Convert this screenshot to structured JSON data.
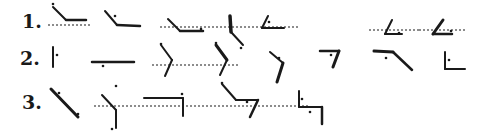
{
  "diagram": {
    "ink_color": "#1a1a1a",
    "background": "#ffffff",
    "rows": [
      {
        "label": "1.",
        "label_pos": [
          22,
          12
        ],
        "figures": [
          {
            "name": "figure-1-1",
            "baselines": [
              [
                48,
                25,
                92,
                25
              ]
            ],
            "strokes": [
              [
                53,
                7,
                66,
                20,
                2
              ],
              [
                66,
                20,
                86,
                20,
                2.5
              ]
            ],
            "dots": [
              [
                53,
                4
              ]
            ]
          },
          {
            "name": "figure-1-2",
            "baselines": [],
            "strokes": [
              [
                105,
                11,
                117,
                25,
                2
              ],
              [
                117,
                25,
                140,
                26,
                2.5
              ]
            ],
            "dots": [
              [
                115,
                16
              ]
            ]
          },
          {
            "name": "figure-1-3",
            "baselines": [
              [
                160,
                27,
                240,
                27
              ]
            ],
            "strokes": [
              [
                168,
                19,
                180,
                31,
                2
              ],
              [
                180,
                31,
                203,
                31,
                2.5
              ]
            ],
            "dots": [
              [
                201,
                29
              ]
            ]
          },
          {
            "name": "figure-1-4",
            "baselines": [
              [
                240,
                27,
                300,
                27
              ]
            ],
            "strokes": [
              [
                230,
                16,
                231,
                32,
                3.5
              ],
              [
                231,
                32,
                243,
                45,
                2
              ]
            ],
            "dots": [
              [
                241,
                48
              ]
            ]
          },
          {
            "name": "figure-1-5",
            "baselines": [],
            "strokes": [
              [
                268,
                16,
                262,
                28,
                2
              ],
              [
                262,
                28,
                284,
                28,
                2
              ]
            ],
            "dots": [
              [
                269,
                22
              ]
            ]
          },
          {
            "name": "figure-1-6",
            "baselines": [
              [
                369,
                30,
                419,
                30
              ]
            ],
            "strokes": [
              [
                392,
                20,
                385,
                34,
                2
              ],
              [
                385,
                34,
                402,
                34,
                2
              ]
            ],
            "dots": [
              [
                399,
                33
              ]
            ]
          },
          {
            "name": "figure-1-7",
            "baselines": [
              [
                419,
                30,
                465,
                30
              ]
            ],
            "strokes": [
              [
                443,
                20,
                433,
                34,
                3
              ],
              [
                433,
                34,
                452,
                34,
                2.5
              ]
            ],
            "dots": [
              [
                451,
                31
              ]
            ]
          }
        ]
      },
      {
        "label": "2.",
        "label_pos": [
          20,
          49
        ],
        "figures": [
          {
            "name": "figure-2-1",
            "baselines": [],
            "strokes": [
              [
                53,
                47,
                53,
                67,
                2
              ]
            ],
            "dots": [
              [
                57,
                55
              ]
            ]
          },
          {
            "name": "figure-2-2",
            "baselines": [],
            "strokes": [
              [
                92,
                62,
                134,
                62,
                2.5
              ]
            ],
            "dots": [
              [
                103,
                66
              ]
            ]
          },
          {
            "name": "figure-2-3",
            "baselines": [
              [
                152,
                65,
                240,
                65
              ]
            ],
            "strokes": [
              [
                161,
                45,
                172,
                60,
                2
              ],
              [
                172,
                60,
                165,
                76,
                2
              ]
            ],
            "dots": [
              [
                161,
                44
              ]
            ]
          },
          {
            "name": "figure-2-4",
            "baselines": [],
            "strokes": [
              [
                216,
                45,
                227,
                60,
                3
              ],
              [
                227,
                60,
                220,
                75,
                2
              ]
            ],
            "dots": [
              [
                216,
                43
              ]
            ]
          },
          {
            "name": "figure-2-5",
            "baselines": [],
            "strokes": [
              [
                270,
                52,
                283,
                63,
                2
              ],
              [
                283,
                63,
                277,
                82,
                3
              ]
            ],
            "dots": [
              [
                279,
                58
              ]
            ]
          },
          {
            "name": "figure-2-6",
            "baselines": [],
            "strokes": [
              [
                320,
                51,
                339,
                51,
                2.5
              ],
              [
                339,
                51,
                333,
                67,
                3
              ]
            ],
            "dots": [
              [
                331,
                55
              ]
            ]
          },
          {
            "name": "figure-2-7",
            "baselines": [],
            "strokes": [
              [
                374,
                51,
                393,
                52,
                3
              ],
              [
                393,
                52,
                412,
                70,
                2.5
              ]
            ],
            "dots": [
              [
                386,
                58
              ]
            ]
          },
          {
            "name": "figure-2-8",
            "baselines": [],
            "strokes": [
              [
                445,
                52,
                445,
                69,
                2
              ],
              [
                445,
                69,
                465,
                69,
                2
              ]
            ],
            "dots": [
              [
                449,
                60
              ]
            ]
          }
        ]
      },
      {
        "label": "3.",
        "label_pos": [
          22,
          93
        ],
        "figures": [
          {
            "name": "figure-3-1",
            "baselines": [],
            "strokes": [
              [
                51,
                89,
                78,
                117,
                3
              ]
            ],
            "dots": [
              [
                59,
                93
              ],
              [
                78,
                114
              ]
            ]
          },
          {
            "name": "figure-3-2",
            "baselines": [
              [
                94,
                106,
                310,
                106
              ]
            ],
            "strokes": [
              [
                102,
                95,
                116,
                110,
                2
              ],
              [
                116,
                110,
                116,
                128,
                2
              ]
            ],
            "dots": [
              [
                116,
                86
              ],
              [
                112,
                129
              ]
            ]
          },
          {
            "name": "figure-3-3",
            "baselines": [],
            "strokes": [
              [
                144,
                98,
                183,
                98,
                2
              ],
              [
                183,
                98,
                183,
                116,
                2
              ]
            ],
            "dots": [
              [
                182,
                94
              ]
            ]
          },
          {
            "name": "figure-3-4",
            "baselines": [],
            "strokes": [
              [
                222,
                84,
                236,
                100,
                2
              ],
              [
                236,
                100,
                258,
                100,
                2
              ],
              [
                258,
                100,
                250,
                117,
                2.5
              ]
            ],
            "dots": [
              [
                222,
                83
              ],
              [
                247,
                102
              ]
            ]
          },
          {
            "name": "figure-3-5",
            "baselines": [],
            "strokes": [
              [
                299,
                91,
                299,
                107,
                2
              ],
              [
                299,
                107,
                322,
                107,
                2
              ],
              [
                322,
                107,
                322,
                124,
                2.5
              ]
            ],
            "dots": [
              [
                302,
                99
              ],
              [
                310,
                112
              ]
            ]
          }
        ]
      }
    ]
  }
}
